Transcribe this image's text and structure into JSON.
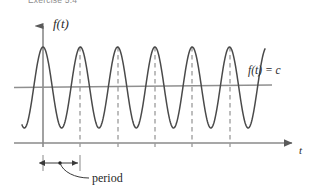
{
  "figure": {
    "exercise_caption": "Exercise 5.4",
    "y_axis_label": "f(t)",
    "x_axis_label": "t",
    "level_line_label": "f(t) = c",
    "period_label": "period",
    "colors": {
      "curve": "#4a4a4a",
      "axis": "#8a8a8a",
      "dashed": "#9a9a9a",
      "text": "#2b2b2b",
      "background": "#ffffff"
    }
  },
  "chart_data": {
    "type": "line",
    "title": "Exercise 5.4",
    "xlabel": "t",
    "ylabel": "f(t)",
    "grid": false,
    "legend": "none",
    "annotations": [
      {
        "name": "level-line",
        "text": "f(t) = c",
        "kind": "horizontal-line",
        "y": 0.0
      },
      {
        "name": "period-measure",
        "text": "period",
        "kind": "double-arrow",
        "x_from": 0.0,
        "x_to": 1.0
      }
    ],
    "axes": {
      "x_axis_y_pixel": 143,
      "y_axis_x_pixel": 43,
      "x_axis_from_pixel": 14,
      "x_axis_to_pixel": 295,
      "y_axis_from_pixel": 143,
      "y_axis_to_pixel": 22
    },
    "series": [
      {
        "name": "f(t)",
        "form": "cosine",
        "amplitude": 40.5,
        "midline_pixel_y": 87.5,
        "peak_pixel_y": 47,
        "trough_pixel_y": 128,
        "period_pixels": 37.3,
        "first_peak_pixel_x": 43,
        "start_pixel_x": 22,
        "end_pixel_x": 265
      }
    ],
    "level_line": {
      "name": "f(t) = c",
      "pixel_y": 86,
      "from_pixel_x": 14,
      "to_pixel_x": 272
    },
    "peak_markers_pixel_x": [
      80,
      118,
      155,
      192,
      230
    ],
    "period_bracket": {
      "pixel_y": 163,
      "from_pixel_x": 43,
      "to_pixel_x": 80,
      "dot_pixel_x": 60
    }
  }
}
